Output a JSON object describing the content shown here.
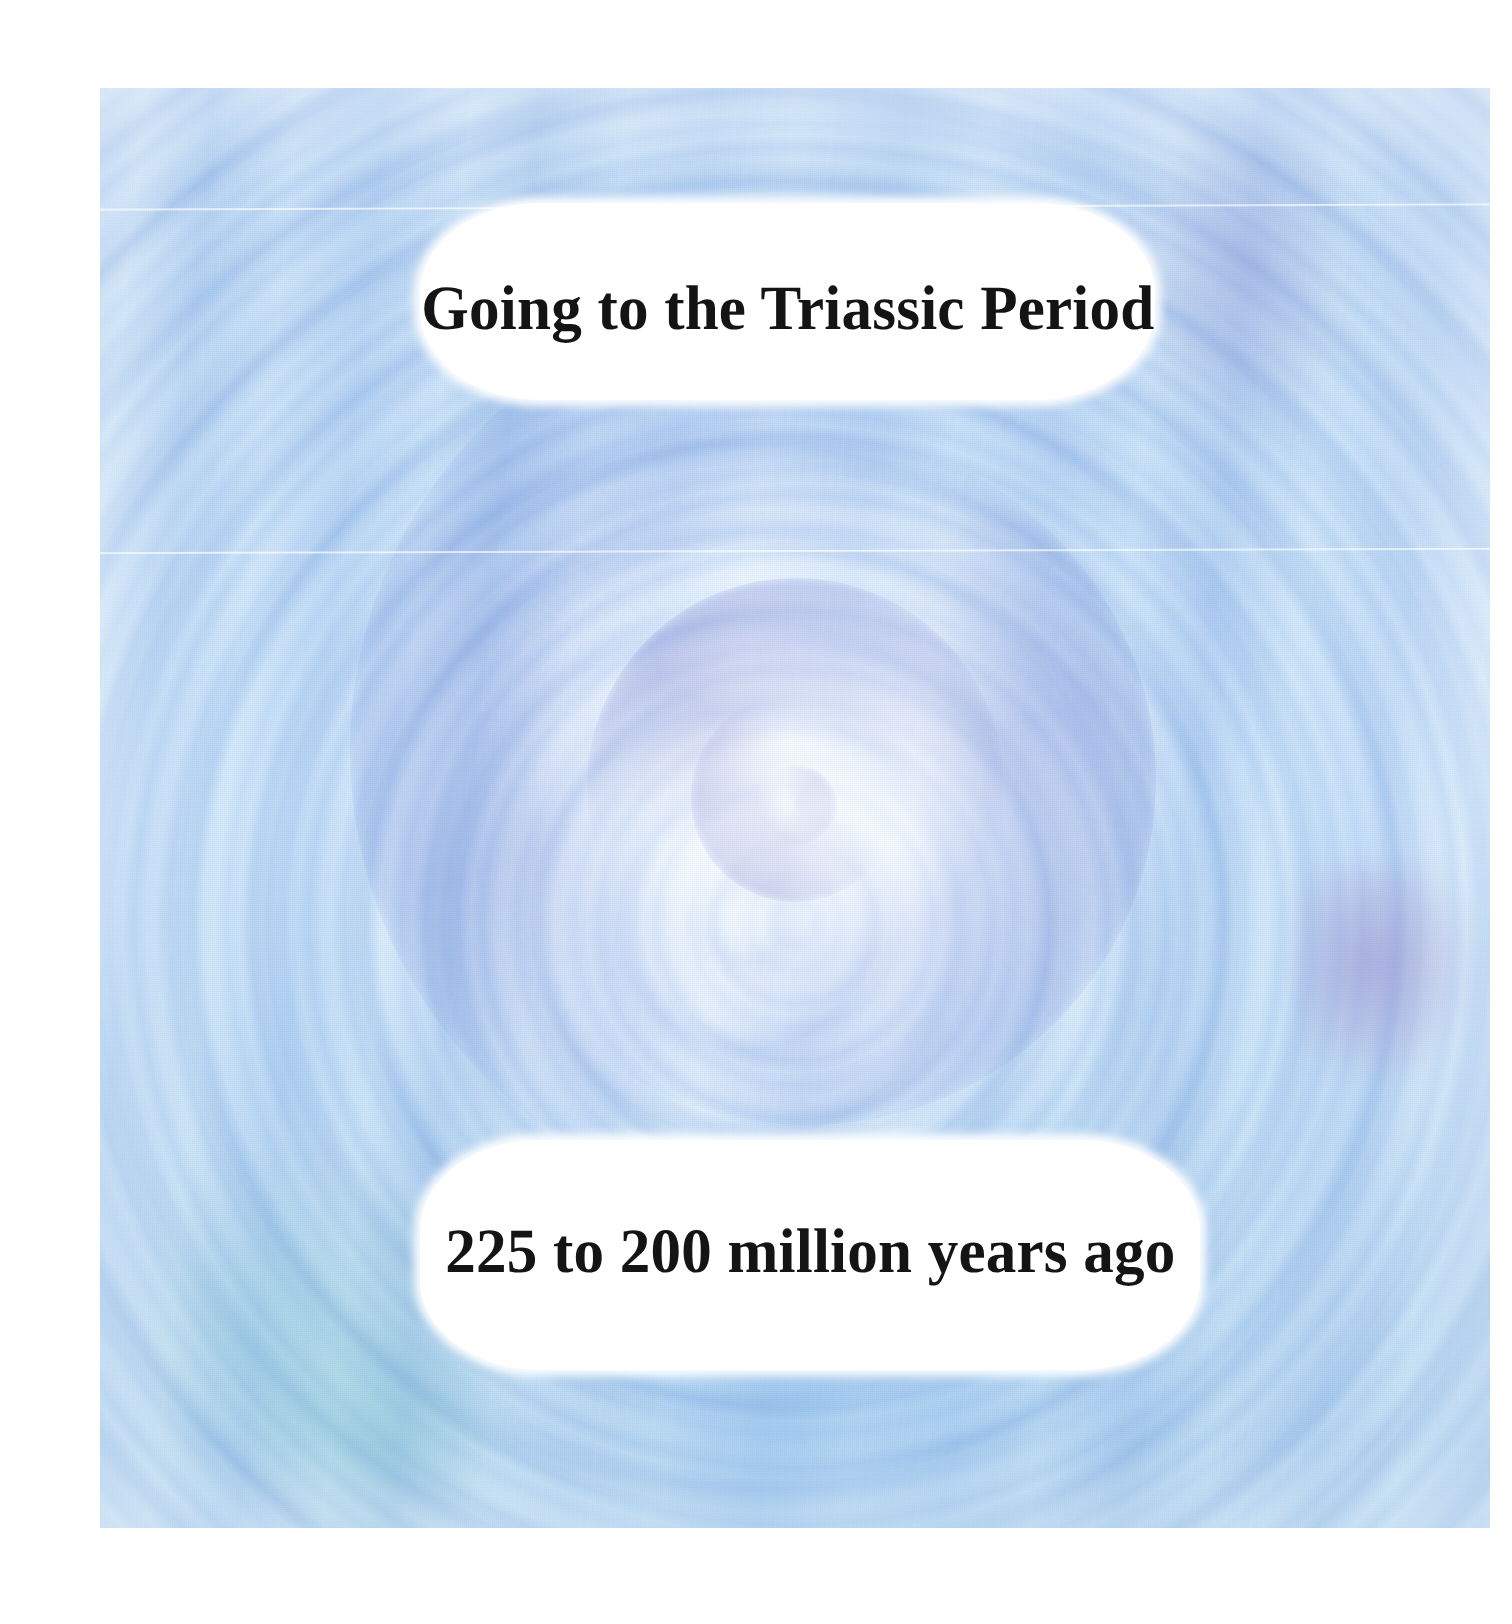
{
  "slide": {
    "title": "Going to the Triassic Period",
    "subtitle": "225 to 200 million years ago",
    "background": {
      "name": "time-vortex-swirl",
      "description": "light blue and lavender spiral vortex",
      "colors": {
        "pale_blue": "#cfe5f8",
        "light_blue": "#9ec3ec",
        "mid_blue": "#8ab6ea",
        "lavender": "#9a90cc",
        "purple_accent": "#9684c8",
        "teal_accent": "#78c8c6",
        "highlight_white": "#fbfdff"
      }
    },
    "callout_background": "#ffffff",
    "text_color": "#141414",
    "page_background": "#ffffff"
  }
}
